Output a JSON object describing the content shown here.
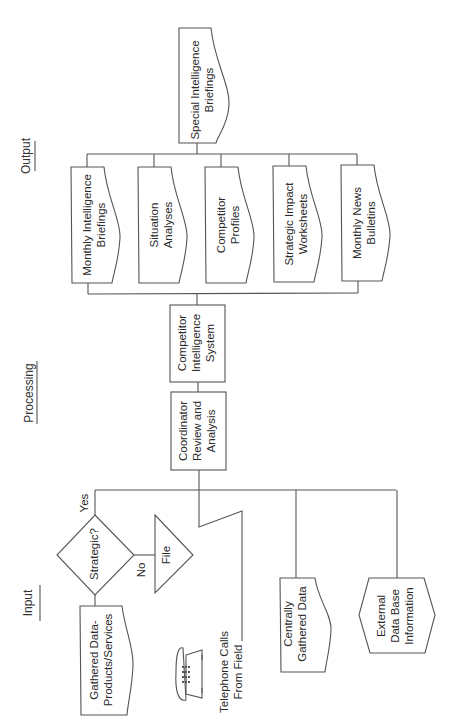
{
  "sections": {
    "input": "Input",
    "processing": "Processing",
    "output": "Output"
  },
  "output": {
    "top": "Special Intelligence\nBriefings",
    "items": [
      "Monthly Intelligence\nBriefings",
      "Situation\nAnalyses",
      "Competitor\nProfiles",
      "Strategic Impact\nWorksheets",
      "Monthly News\nBulletins"
    ]
  },
  "processing": {
    "system": "Competitor\nIntelligence\nSystem",
    "coordinator": "Coordinator\nReview and\nAnalysis"
  },
  "input": {
    "decision": "Strategic?",
    "yes": "Yes",
    "no": "No",
    "file": "File",
    "gathered": "Gathered Data-\nProducts/Services",
    "telephone": "Telephone Calls\nFrom Field",
    "telephone_icon": "telephone-icon",
    "central": "Centrally\nGathered Data",
    "external": "External\nData Base\nInformation"
  },
  "colors": {
    "line": "#555555",
    "text": "#2a2a2a",
    "background": "#ffffff"
  }
}
